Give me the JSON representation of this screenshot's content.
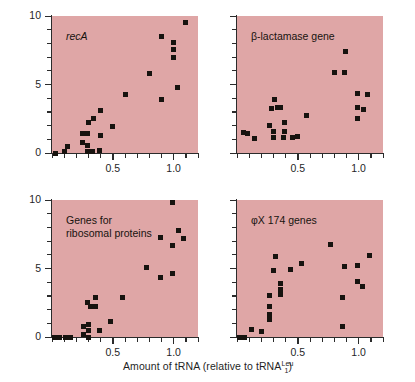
{
  "figure": {
    "xlabel_prefix": "Amount of tRNA (relative to tRNA",
    "xlabel_sup": "Leu",
    "xlabel_sub": "1",
    "xlabel_suffix": ")",
    "ylabel": "Frequency of tRNA usage (percent)",
    "panel_bg_color": "#dfa6a6",
    "marker_color": "#17130f",
    "axis_color": "#2b2b2b"
  },
  "axes": {
    "xlim": [
      0.0,
      1.2
    ],
    "ylim": [
      0,
      10
    ],
    "x_major_labels": [
      "0.5",
      "1.0"
    ],
    "x_major_values": [
      0.5,
      1.0
    ],
    "x_tick_step": 0.1,
    "y_major_labels": [
      "0",
      "5",
      "10"
    ],
    "y_major_values": [
      0,
      5,
      10
    ],
    "y_tick_step": 1
  },
  "chart_data": [
    {
      "type": "scatter",
      "title": "recA",
      "title_style": "italic",
      "xlabel": "Amount of tRNA (relative to tRNA1Leu)",
      "ylabel": "Frequency of tRNA usage (percent)",
      "xlim": [
        0.0,
        1.2
      ],
      "ylim": [
        0,
        10
      ],
      "grid": false,
      "legend": "none",
      "points": [
        {
          "x": 0.03,
          "y": 0.0
        },
        {
          "x": 0.1,
          "y": 0.1
        },
        {
          "x": 0.13,
          "y": 0.45
        },
        {
          "x": 0.25,
          "y": 0.75
        },
        {
          "x": 0.25,
          "y": 1.4
        },
        {
          "x": 0.29,
          "y": 0.1
        },
        {
          "x": 0.29,
          "y": 0.55
        },
        {
          "x": 0.29,
          "y": 1.4
        },
        {
          "x": 0.3,
          "y": 2.25
        },
        {
          "x": 0.33,
          "y": 0.1
        },
        {
          "x": 0.34,
          "y": 2.5
        },
        {
          "x": 0.39,
          "y": 0.2
        },
        {
          "x": 0.4,
          "y": 1.25
        },
        {
          "x": 0.4,
          "y": 3.1
        },
        {
          "x": 0.5,
          "y": 1.9
        },
        {
          "x": 0.6,
          "y": 4.25
        },
        {
          "x": 0.8,
          "y": 5.8
        },
        {
          "x": 0.9,
          "y": 3.9
        },
        {
          "x": 0.9,
          "y": 8.5
        },
        {
          "x": 1.0,
          "y": 7.0
        },
        {
          "x": 1.0,
          "y": 7.55
        },
        {
          "x": 1.0,
          "y": 8.1
        },
        {
          "x": 1.03,
          "y": 4.8
        },
        {
          "x": 1.1,
          "y": 9.5
        }
      ]
    },
    {
      "type": "scatter",
      "title": "β-lactamase gene",
      "title_style": "normal",
      "xlabel": "Amount of tRNA (relative to tRNA1Leu)",
      "ylabel": "Frequency of tRNA usage (percent)",
      "xlim": [
        0.0,
        1.2
      ],
      "ylim": [
        0,
        10
      ],
      "grid": false,
      "legend": "none",
      "points": [
        {
          "x": 0.05,
          "y": 1.5
        },
        {
          "x": 0.09,
          "y": 1.45
        },
        {
          "x": 0.14,
          "y": 1.05
        },
        {
          "x": 0.27,
          "y": 2.0
        },
        {
          "x": 0.28,
          "y": 3.25
        },
        {
          "x": 0.3,
          "y": 1.15
        },
        {
          "x": 0.3,
          "y": 1.6
        },
        {
          "x": 0.31,
          "y": 3.9
        },
        {
          "x": 0.33,
          "y": 3.35
        },
        {
          "x": 0.36,
          "y": 3.3
        },
        {
          "x": 0.38,
          "y": 1.15
        },
        {
          "x": 0.39,
          "y": 2.2
        },
        {
          "x": 0.39,
          "y": 1.6
        },
        {
          "x": 0.46,
          "y": 1.15
        },
        {
          "x": 0.5,
          "y": 1.2
        },
        {
          "x": 0.57,
          "y": 2.75
        },
        {
          "x": 0.8,
          "y": 5.85
        },
        {
          "x": 0.88,
          "y": 5.85
        },
        {
          "x": 0.89,
          "y": 7.4
        },
        {
          "x": 0.99,
          "y": 2.5
        },
        {
          "x": 0.99,
          "y": 3.3
        },
        {
          "x": 0.99,
          "y": 4.35
        },
        {
          "x": 1.04,
          "y": 3.15
        },
        {
          "x": 1.07,
          "y": 4.25
        }
      ]
    },
    {
      "type": "scatter",
      "title": "Genes for ribosomal proteins",
      "title_style": "normal",
      "xlabel": "Amount of tRNA (relative to tRNA1Leu)",
      "ylabel": "Frequency of tRNA usage (percent)",
      "xlim": [
        0.0,
        1.2
      ],
      "ylim": [
        0,
        10
      ],
      "grid": false,
      "legend": "none",
      "points": [
        {
          "x": 0.02,
          "y": 0.0
        },
        {
          "x": 0.06,
          "y": 0.0
        },
        {
          "x": 0.11,
          "y": 0.0
        },
        {
          "x": 0.15,
          "y": 0.0
        },
        {
          "x": 0.26,
          "y": 0.2
        },
        {
          "x": 0.26,
          "y": 0.75
        },
        {
          "x": 0.3,
          "y": 0.0
        },
        {
          "x": 0.3,
          "y": 0.45
        },
        {
          "x": 0.3,
          "y": 0.9
        },
        {
          "x": 0.29,
          "y": 2.55
        },
        {
          "x": 0.32,
          "y": 2.25
        },
        {
          "x": 0.36,
          "y": 2.2
        },
        {
          "x": 0.36,
          "y": 2.85
        },
        {
          "x": 0.39,
          "y": 0.45
        },
        {
          "x": 0.48,
          "y": 1.1
        },
        {
          "x": 0.58,
          "y": 2.85
        },
        {
          "x": 0.78,
          "y": 5.05
        },
        {
          "x": 0.89,
          "y": 4.35
        },
        {
          "x": 0.89,
          "y": 7.25
        },
        {
          "x": 0.99,
          "y": 4.65
        },
        {
          "x": 0.99,
          "y": 6.7
        },
        {
          "x": 0.99,
          "y": 9.85
        },
        {
          "x": 1.04,
          "y": 7.75
        },
        {
          "x": 1.08,
          "y": 7.2
        }
      ]
    },
    {
      "type": "scatter",
      "title": "φX 174 genes",
      "title_style": "normal",
      "xlabel": "Amount of tRNA (relative to tRNA1Leu)",
      "ylabel": "Frequency of tRNA usage (percent)",
      "xlim": [
        0.0,
        1.2
      ],
      "ylim": [
        0,
        10
      ],
      "grid": false,
      "legend": "none",
      "points": [
        {
          "x": 0.02,
          "y": 0.0
        },
        {
          "x": 0.06,
          "y": 0.0
        },
        {
          "x": 0.12,
          "y": 0.55
        },
        {
          "x": 0.2,
          "y": 0.4
        },
        {
          "x": 0.27,
          "y": 1.25
        },
        {
          "x": 0.27,
          "y": 1.65
        },
        {
          "x": 0.27,
          "y": 2.2
        },
        {
          "x": 0.27,
          "y": 3.05
        },
        {
          "x": 0.3,
          "y": 4.85
        },
        {
          "x": 0.32,
          "y": 5.85
        },
        {
          "x": 0.36,
          "y": 3.1
        },
        {
          "x": 0.36,
          "y": 3.5
        },
        {
          "x": 0.36,
          "y": 3.9
        },
        {
          "x": 0.44,
          "y": 4.9
        },
        {
          "x": 0.53,
          "y": 5.35
        },
        {
          "x": 0.77,
          "y": 6.75
        },
        {
          "x": 0.87,
          "y": 0.8
        },
        {
          "x": 0.87,
          "y": 2.85
        },
        {
          "x": 0.88,
          "y": 5.15
        },
        {
          "x": 0.99,
          "y": 4.05
        },
        {
          "x": 0.99,
          "y": 5.25
        },
        {
          "x": 1.03,
          "y": 3.7
        },
        {
          "x": 1.09,
          "y": 5.95
        }
      ]
    }
  ]
}
